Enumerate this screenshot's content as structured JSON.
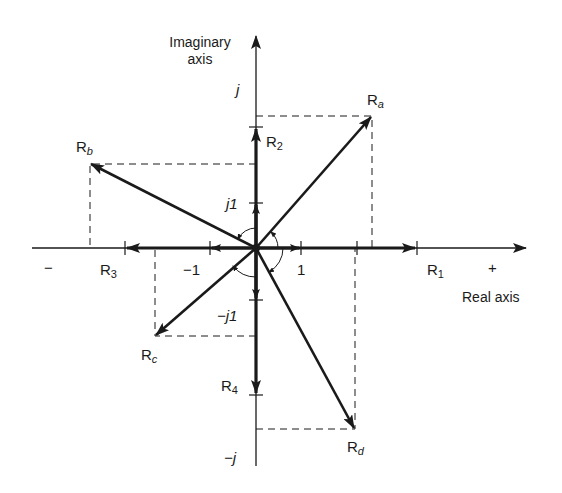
{
  "axes": {
    "imaginary_title_line1": "Imaginary",
    "imaginary_title_line2": "axis",
    "real_title": "Real axis",
    "imag_pos_label": "j",
    "imag_neg_label": "−j",
    "real_pos_label": "+",
    "real_neg_label": "−",
    "tick_j1": "j1",
    "tick_neg_j1": "−j1",
    "tick_1": "1",
    "tick_neg1": "−1"
  },
  "phasors": [
    {
      "name": "R1",
      "base": "R",
      "sub": "1",
      "value": "2",
      "direction": "+real"
    },
    {
      "name": "R2",
      "base": "R",
      "sub": "2",
      "value": "j2",
      "direction": "+imag"
    },
    {
      "name": "R3",
      "base": "R",
      "sub": "3",
      "value": "-2",
      "direction": "-real"
    },
    {
      "name": "R4",
      "base": "R",
      "sub": "4",
      "value": "-j2",
      "direction": "-imag"
    },
    {
      "name": "Ra",
      "base": "R",
      "sub": "a",
      "value": "1.6+j2.0",
      "quadrant": "I"
    },
    {
      "name": "Rb",
      "base": "R",
      "sub": "b",
      "value": "-2.5+j1.3",
      "quadrant": "II"
    },
    {
      "name": "Rc",
      "base": "R",
      "sub": "c",
      "value": "-1.5-j1.4",
      "quadrant": "III"
    },
    {
      "name": "Rd",
      "base": "R",
      "sub": "d",
      "value": "1.4-j2.8",
      "quadrant": "IV"
    }
  ],
  "colors": {
    "ink": "#1a1a1a",
    "background": "#ffffff"
  }
}
